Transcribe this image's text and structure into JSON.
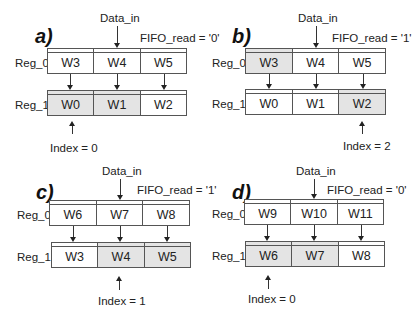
{
  "common": {
    "data_in_label": "Data_in",
    "reg0_label": "Reg_0",
    "reg1_label": "Reg_1"
  },
  "panels": [
    {
      "letter": "a)",
      "fifo_read": "FIFO_read = '0'",
      "reg0": [
        {
          "text": "W3",
          "shaded": false
        },
        {
          "text": "W4",
          "shaded": false
        },
        {
          "text": "W5",
          "shaded": false
        }
      ],
      "reg1": [
        {
          "text": "W0",
          "shaded": true
        },
        {
          "text": "W1",
          "shaded": true
        },
        {
          "text": "W2",
          "shaded": false
        }
      ],
      "index_label": "Index = 0",
      "index": 0
    },
    {
      "letter": "b)",
      "fifo_read": "FIFO_read = '1'",
      "reg0": [
        {
          "text": "W3",
          "shaded": true
        },
        {
          "text": "W4",
          "shaded": false
        },
        {
          "text": "W5",
          "shaded": false
        }
      ],
      "reg1": [
        {
          "text": "W0",
          "shaded": false
        },
        {
          "text": "W1",
          "shaded": false
        },
        {
          "text": "W2",
          "shaded": true
        }
      ],
      "index_label": "Index = 2",
      "index": 2
    },
    {
      "letter": "c)",
      "fifo_read": "FIFO_read = '1'",
      "reg0": [
        {
          "text": "W6",
          "shaded": false
        },
        {
          "text": "W7",
          "shaded": false
        },
        {
          "text": "W8",
          "shaded": false
        }
      ],
      "reg1": [
        {
          "text": "W3",
          "shaded": false
        },
        {
          "text": "W4",
          "shaded": true
        },
        {
          "text": "W5",
          "shaded": true
        }
      ],
      "index_label": "Index = 1",
      "index": 1
    },
    {
      "letter": "d)",
      "fifo_read": "FIFO_read = '0'",
      "reg0": [
        {
          "text": "W9",
          "shaded": false
        },
        {
          "text": "W10",
          "shaded": false
        },
        {
          "text": "W11",
          "shaded": false
        }
      ],
      "reg1": [
        {
          "text": "W6",
          "shaded": true
        },
        {
          "text": "W7",
          "shaded": true
        },
        {
          "text": "W8",
          "shaded": false
        }
      ],
      "index_label": "Index = 0",
      "index": 0
    }
  ],
  "colors": {
    "shaded_cell": "#e4e4e4",
    "border": "#555555"
  }
}
